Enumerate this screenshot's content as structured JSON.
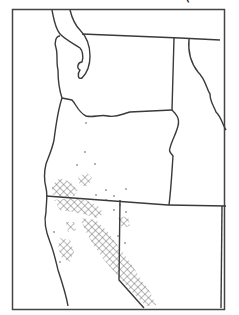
{
  "map": {
    "type": "range-map",
    "region": "Western United States (Pacific Northwest and California)",
    "states_shown": [
      "Washington",
      "Oregon",
      "California",
      "Idaho",
      "Nevada"
    ],
    "legend": {
      "crosshatch": "range area",
      "dots": "scattered occurrences"
    },
    "colors": {
      "line": "#3a3a3a",
      "background": "#ffffff",
      "hatch": "#555555"
    }
  }
}
